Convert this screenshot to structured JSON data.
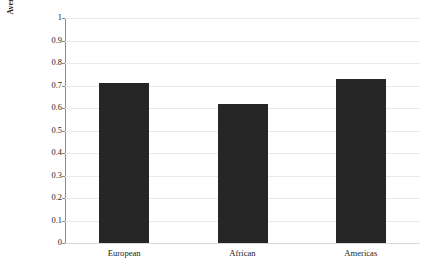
{
  "chart_data": {
    "type": "bar",
    "title": "",
    "subtitle": "",
    "xlabel": "",
    "ylabel": "Average level of formal independence (cumulative index)",
    "ylabel_line1": "Average level of formal independence",
    "ylabel_line2": "(cumulative index)",
    "categories": [
      "European",
      "African",
      "Americas"
    ],
    "values": [
      0.71,
      0.62,
      0.73
    ],
    "series": [
      {
        "name": "Average level of formal independence",
        "values": [
          0.71,
          0.62,
          0.73
        ]
      }
    ],
    "ylim": [
      0,
      1
    ],
    "xlim": [
      0,
      3
    ],
    "ytick_labels": [
      "1",
      "0.9",
      "0.8",
      "0.7",
      "0.6",
      "0.5",
      "0.4",
      "0.3",
      "0.2",
      "0.1",
      "0"
    ],
    "ytick_values": [
      1,
      0.9,
      0.8,
      0.7,
      0.6,
      0.5,
      0.4,
      0.3,
      0.2,
      0.1,
      0
    ],
    "grid": "horizontal",
    "legend": "none",
    "annotations": [],
    "bar_color": "#262626",
    "gridline_color": "#e9e9e9",
    "axis_color": "#8a8a8a",
    "background_color": "#ffffff"
  }
}
